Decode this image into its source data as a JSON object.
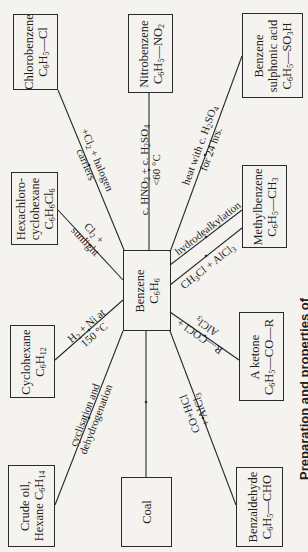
{
  "caption": "Preparation and properties of",
  "center": {
    "name": "Benzene",
    "formula": "C6H6"
  },
  "compounds": [
    {
      "id": "chlorobenzene",
      "name": "Chlorobenzene",
      "formula": "C6H5—Cl"
    },
    {
      "id": "nitrobenzene",
      "name": "Nitrobenzene",
      "formula": "C6H5—NO2"
    },
    {
      "id": "benzene-sulphonic-acid",
      "name1": "Benzene",
      "name2": "sulphonic acid",
      "formula": "C6H5—SO3H"
    },
    {
      "id": "hexachlorocyclohexane",
      "name1": "Hexachloro-",
      "name2": "cyclohexane",
      "formula": "C6H6Cl6"
    },
    {
      "id": "methylbenzene",
      "name": "Methylbenzene",
      "formula": "C6H5—CH3"
    },
    {
      "id": "cyclohexane",
      "name": "Cyclohexane",
      "formula": "C6H12"
    },
    {
      "id": "ketone",
      "name": "A ketone",
      "formula": "C6H5—CO—R"
    },
    {
      "id": "crude-oil",
      "name1": "Crude oil,",
      "name2": "Hexane C6H14"
    },
    {
      "id": "coal",
      "name": "Coal"
    },
    {
      "id": "benzaldehyde",
      "name": "Benzaldehyde",
      "formula": "C6H5—CHO"
    }
  ],
  "reactions": {
    "chlorination_1": "+Cl2 + halogen",
    "chlorination_2": "carriers",
    "nitration_1": "c. HNO3 + c. H2SO4",
    "nitration_2": "<60 °C",
    "sulphonation_1": "heat with c. H2SO4",
    "sulphonation_2": "for 24 hrs.",
    "addition_1": "Cl2 +",
    "addition_2": "sunlight",
    "hydrodealkylation": "hydrodealkylation",
    "alkylation": "CH3Cl + AlCl3",
    "hydrogenation_1": "H2 + Ni at",
    "hydrogenation_2": "150 °C",
    "acylation_1": "R—COCl +",
    "acylation_2": "AlCl3",
    "cyclisation_1": "cyclisation and",
    "cyclisation_2": "dehydrogenation",
    "gattermann_1": "CO+HCl",
    "gattermann_2": "+ AlCl3"
  }
}
